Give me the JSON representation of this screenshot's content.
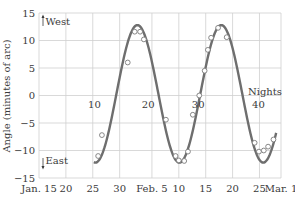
{
  "chart_data": {
    "type": "line",
    "title": "",
    "xlabel": "",
    "ylabel": "Angle (minutes of arc)",
    "xlim_days": [
      0,
      45
    ],
    "ylim": [
      -15,
      15
    ],
    "grid": true,
    "x_tick_labels": [
      "Jan. 15",
      "20",
      "25",
      "30",
      "Feb. 5",
      "10",
      "15",
      "20",
      "25",
      "Mar. 1"
    ],
    "x_tick_days": [
      0,
      5,
      10,
      15,
      21,
      26,
      31,
      36,
      41,
      45
    ],
    "y_ticks": [
      15,
      10,
      5,
      0,
      -5,
      -10,
      -15
    ],
    "annotations": {
      "west": "West",
      "east": "East",
      "nights_label": "Nights",
      "night_marks": [
        {
          "label": "10",
          "day": 10.3
        },
        {
          "label": "20",
          "day": 20.3
        },
        {
          "label": "30",
          "day": 29.6
        },
        {
          "label": "40",
          "day": 40.8
        }
      ]
    },
    "series": [
      {
        "name": "observations",
        "style": "open-circles",
        "points": [
          [
            11.0,
            -11.0
          ],
          [
            11.7,
            -7.2
          ],
          [
            16.5,
            6.0
          ],
          [
            17.8,
            11.6
          ],
          [
            18.8,
            11.6
          ],
          [
            19.5,
            10.2
          ],
          [
            23.6,
            -4.4
          ],
          [
            25.4,
            -11.0
          ],
          [
            26.0,
            -11.8
          ],
          [
            27.0,
            -11.9
          ],
          [
            27.7,
            -10.2
          ],
          [
            28.6,
            -3.5
          ],
          [
            29.8,
            0.0
          ],
          [
            30.8,
            4.5
          ],
          [
            31.4,
            8.3
          ],
          [
            32.0,
            10.5
          ],
          [
            33.3,
            12.3
          ],
          [
            34.9,
            10.6
          ],
          [
            40.1,
            -8.6
          ],
          [
            40.9,
            -10.2
          ],
          [
            41.8,
            -10.0
          ],
          [
            42.6,
            -9.3
          ],
          [
            43.6,
            -8.0
          ]
        ]
      },
      {
        "name": "fit",
        "style": "sinusoid",
        "amplitude": 12.5,
        "period_days": 15.6,
        "peak_day": 18.3,
        "offset": 0.3
      }
    ]
  }
}
